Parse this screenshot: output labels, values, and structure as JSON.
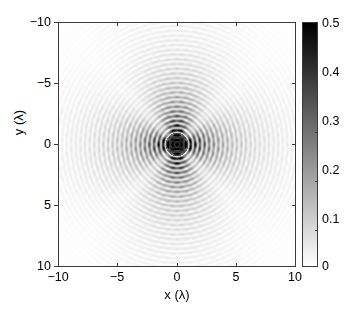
{
  "figure": {
    "background_color": "#ffffff",
    "axis_color": "#3a3a3a",
    "type": "2d-intensity-map"
  },
  "axes": {
    "xlabel": "x (λ)",
    "ylabel": "y (λ)",
    "xticklabels": [
      "−10",
      "−5",
      "0",
      "5",
      "10"
    ],
    "yticklabels": [
      "−10",
      "−5",
      "0",
      "5",
      "10"
    ]
  },
  "colorbar": {
    "ticklabels": [
      "0.5",
      "0.4",
      "0.3",
      "0.2",
      "0.1",
      "0"
    ],
    "min_color": "#ffffff",
    "max_color": "#000000",
    "orientation": "vertical",
    "position": "right"
  },
  "chart_data": {
    "type": "heatmap",
    "title": "",
    "xlabel": "x (λ)",
    "ylabel": "y (λ)",
    "xlim": [
      -10,
      10
    ],
    "ylim": [
      -10,
      10
    ],
    "y_axis_inverted": true,
    "xticks": [
      -10,
      -5,
      0,
      5,
      10
    ],
    "yticks": [
      -10,
      -5,
      0,
      5,
      10
    ],
    "grid": false,
    "colormap": "gray-reversed",
    "clim": [
      0,
      0.5
    ],
    "colorbar_ticks": [
      0,
      0.1,
      0.2,
      0.3,
      0.4,
      0.5
    ],
    "legend": "none",
    "field_model": {
      "ring_period_lambda": 0.39,
      "core_radius_lambda": 0.95,
      "core_value": 0.5,
      "envelope_lobe_axes": [
        "+x",
        "-x",
        "+y",
        "-y"
      ],
      "lobe_reach_lambda": {
        "x": 9.0,
        "y": 10.0
      },
      "radial_decay_lambda": 4.2,
      "background_value": 0.0,
      "peak_value": 0.5
    },
    "sampled_radial_profile": {
      "r_lambda": [
        0.0,
        0.5,
        1.0,
        1.5,
        2.0,
        2.5,
        3.0,
        3.5,
        4.0,
        5.0,
        6.0,
        7.0,
        8.0,
        9.0,
        10.0
      ],
      "envelope_value": [
        0.5,
        0.5,
        0.42,
        0.22,
        0.16,
        0.13,
        0.11,
        0.095,
        0.082,
        0.062,
        0.046,
        0.034,
        0.025,
        0.017,
        0.01
      ]
    }
  }
}
